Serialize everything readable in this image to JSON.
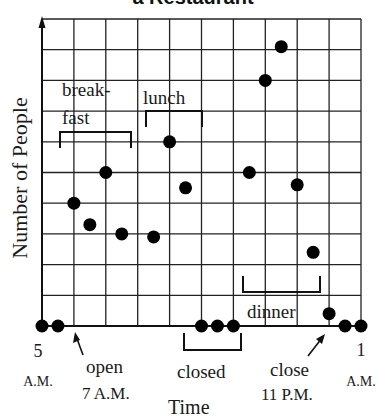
{
  "chart_data": {
    "type": "scatter",
    "title": "a Restaurant",
    "xlabel": "Time",
    "ylabel": "Number of People",
    "grid": true,
    "x_ticks": [
      {
        "label": "5",
        "sub": "A.M.",
        "hour": 0
      },
      {
        "label": "1",
        "sub": "A.M.",
        "hour": 20
      }
    ],
    "x_range_hours": [
      0,
      20
    ],
    "x_range_labels": [
      "5 A.M.",
      "1 A.M."
    ],
    "y_range": [
      0,
      10
    ],
    "y_tick_labels": "none",
    "points": [
      {
        "time": "5 A.M.",
        "hour": 0,
        "value": 0
      },
      {
        "time": "6 A.M.",
        "hour": 1,
        "value": 0
      },
      {
        "time": "7 A.M.",
        "hour": 2,
        "value": 4
      },
      {
        "time": "8 A.M.",
        "hour": 3,
        "value": 3.3
      },
      {
        "time": "9 A.M.",
        "hour": 4,
        "value": 5
      },
      {
        "time": "10 A.M.",
        "hour": 5,
        "value": 3
      },
      {
        "time": "12 P.M.",
        "hour": 7,
        "value": 2.9
      },
      {
        "time": "1 P.M.",
        "hour": 8,
        "value": 6
      },
      {
        "time": "2 P.M.",
        "hour": 9,
        "value": 4.5
      },
      {
        "time": "3 P.M.",
        "hour": 10,
        "value": 0
      },
      {
        "time": "4 P.M.",
        "hour": 11,
        "value": 0
      },
      {
        "time": "5 P.M.",
        "hour": 12,
        "value": 0
      },
      {
        "time": "6 P.M.",
        "hour": 13,
        "value": 5
      },
      {
        "time": "7 P.M.",
        "hour": 14,
        "value": 8
      },
      {
        "time": "8 P.M.",
        "hour": 15,
        "value": 9.1
      },
      {
        "time": "9 P.M.",
        "hour": 16,
        "value": 4.6
      },
      {
        "time": "10 P.M.",
        "hour": 17,
        "value": 2.4
      },
      {
        "time": "11 P.M.",
        "hour": 18,
        "value": 0.4
      },
      {
        "time": "12 A.M.",
        "hour": 19,
        "value": 0
      },
      {
        "time": "1 A.M.",
        "hour": 20,
        "value": 0
      }
    ],
    "annotations": [
      {
        "text": "breakfast",
        "lines": [
          "break-",
          "fast"
        ],
        "type": "bracket"
      },
      {
        "text": "lunch",
        "type": "bracket"
      },
      {
        "text": "dinner",
        "type": "bracket"
      },
      {
        "text": "closed",
        "type": "bracket"
      },
      {
        "text": "open",
        "sub": "7 A.M.",
        "type": "arrow"
      },
      {
        "text": "close",
        "sub": "11 P.M.",
        "type": "arrow"
      }
    ]
  },
  "labels": {
    "title": "a Restaurant",
    "ylabel": "Number of People",
    "xlabel": "Time",
    "start_num": "5",
    "start_sub": "A.M.",
    "end_num": "1",
    "end_sub": "A.M.",
    "breakfast_1": "break-",
    "breakfast_2": "fast",
    "lunch": "lunch",
    "dinner": "dinner",
    "closed": "closed",
    "open": "open",
    "open_time": "7 A.M.",
    "close": "close",
    "close_time": "11 P.M."
  }
}
